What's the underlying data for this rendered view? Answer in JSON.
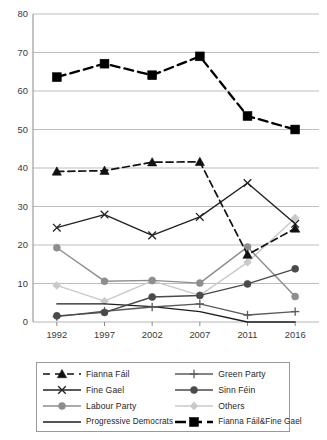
{
  "chart_data": {
    "type": "line",
    "title": "",
    "xlabel": "",
    "ylabel": "",
    "categories": [
      "1992",
      "1997",
      "2002",
      "2007",
      "2011",
      "2016"
    ],
    "ylim": [
      0,
      80
    ],
    "yticks": [
      0,
      10,
      20,
      30,
      40,
      50,
      60,
      70,
      80
    ],
    "grid": "horizontal",
    "legend_position": "bottom",
    "legend_columns": 2,
    "series": [
      {
        "name": "Fianna Fáil",
        "marker": "triangle",
        "linestyle": "dashed",
        "color": "#111111",
        "values": [
          39.1,
          39.3,
          41.5,
          41.6,
          17.5,
          24.3
        ]
      },
      {
        "name": "Green Party",
        "marker": "plus",
        "linestyle": "solid",
        "color": "#5a5a5a",
        "values": [
          1.4,
          2.8,
          3.9,
          4.7,
          1.8,
          2.7
        ]
      },
      {
        "name": "Fine Gael",
        "marker": "x",
        "linestyle": "solid",
        "color": "#222222",
        "values": [
          24.5,
          27.9,
          22.5,
          27.3,
          36.1,
          25.5
        ]
      },
      {
        "name": "Sinn Féin",
        "marker": "circle",
        "linestyle": "solid",
        "color": "#4a4a4a",
        "values": [
          1.6,
          2.5,
          6.5,
          6.9,
          9.9,
          13.8
        ]
      },
      {
        "name": "Labour Party",
        "marker": "circle",
        "linestyle": "solid",
        "color": "#8d8d8d",
        "values": [
          19.3,
          10.6,
          10.8,
          10.1,
          19.5,
          6.6
        ]
      },
      {
        "name": "Others",
        "marker": "diamond",
        "linestyle": "solid",
        "color": "#c9c9c9",
        "values": [
          9.5,
          5.4,
          10.7,
          6.9,
          15.5,
          27.0
        ]
      },
      {
        "name": "Progressive Democrats",
        "marker": "none",
        "linestyle": "solid",
        "color": "#1d1d1d",
        "values": [
          4.7,
          4.7,
          4.0,
          2.7,
          0.0,
          0.0
        ]
      },
      {
        "name": "Fianna Fáil&Fine Gael",
        "marker": "square",
        "linestyle": "dashed",
        "color": "#000000",
        "values": [
          63.6,
          67.1,
          64.1,
          69.0,
          53.5,
          50.0
        ]
      }
    ]
  },
  "axis": {
    "y_tick_labels": [
      "80",
      "70",
      "60",
      "50",
      "40",
      "30",
      "20",
      "10",
      "0"
    ],
    "x_tick_labels": [
      "1992",
      "1997",
      "2002",
      "2007",
      "2011",
      "2016"
    ]
  },
  "legend": {
    "entries": [
      {
        "label": "Fianna Fáil"
      },
      {
        "label": "Green Party"
      },
      {
        "label": "Fine Gael"
      },
      {
        "label": "Sinn Féin"
      },
      {
        "label": "Labour Party"
      },
      {
        "label": "Others"
      },
      {
        "label": "Progressive Democrats"
      },
      {
        "label": "Fianna Fáil&Fine Gael"
      }
    ]
  },
  "colors": {
    "grid": "#b5b5b5",
    "axis": "#8a8a8a",
    "text": "#2b2b2b",
    "legend_border": "#9a9a9a"
  }
}
